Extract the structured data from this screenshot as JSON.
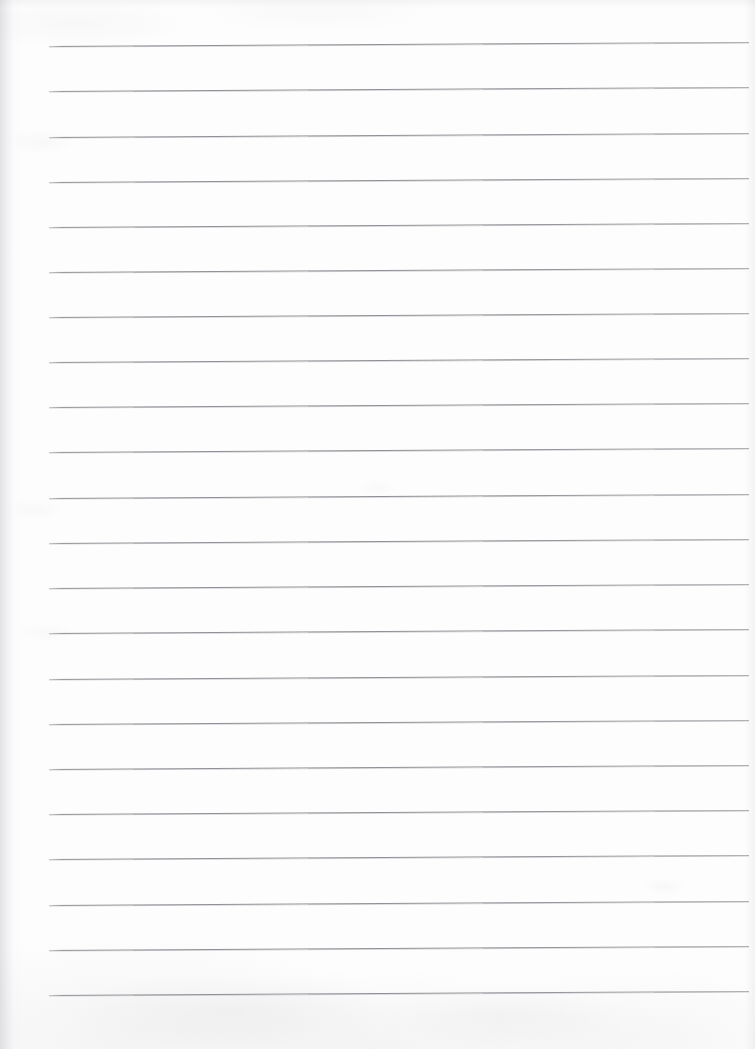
{
  "document": {
    "kind": "scanned-ruled-paper",
    "title": "Lined Notebook Page",
    "content_text": "",
    "is_blank": "true",
    "page_width": 755,
    "page_height": 1049,
    "background_color": "#fdfdfd",
    "rule_color": "#909096",
    "rule_thickness_px": 1,
    "rule_count": 22,
    "rule_left_x": 49,
    "rule_right_x": 749,
    "rule_first_y": 46,
    "rule_spacing_px": 45.2,
    "skew_degrees": -0.33,
    "has_margin_line": "false",
    "rules": [
      {
        "index": 1,
        "y": 46
      },
      {
        "index": 2,
        "y": 91
      },
      {
        "index": 3,
        "y": 137
      },
      {
        "index": 4,
        "y": 182
      },
      {
        "index": 5,
        "y": 227
      },
      {
        "index": 6,
        "y": 272
      },
      {
        "index": 7,
        "y": 317
      },
      {
        "index": 8,
        "y": 362
      },
      {
        "index": 9,
        "y": 407
      },
      {
        "index": 10,
        "y": 452
      },
      {
        "index": 11,
        "y": 498
      },
      {
        "index": 12,
        "y": 543
      },
      {
        "index": 13,
        "y": 588
      },
      {
        "index": 14,
        "y": 633
      },
      {
        "index": 15,
        "y": 679
      },
      {
        "index": 16,
        "y": 724
      },
      {
        "index": 17,
        "y": 769
      },
      {
        "index": 18,
        "y": 814
      },
      {
        "index": 19,
        "y": 859
      },
      {
        "index": 20,
        "y": 905
      },
      {
        "index": 21,
        "y": 950
      },
      {
        "index": 22,
        "y": 995
      }
    ]
  }
}
